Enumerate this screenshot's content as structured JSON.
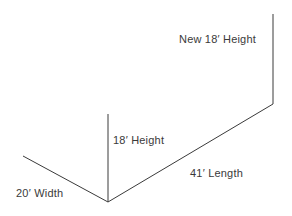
{
  "canvas": {
    "width": 292,
    "height": 216,
    "background_color": "#ffffff",
    "stroke_color": "#3a3a3a",
    "text_color": "#3a3a3a"
  },
  "diagram": {
    "labels": {
      "new_height": "New 18′ Height",
      "height": "18′ Height",
      "length": "41′ Length",
      "width": "20′ Width"
    },
    "measurements": [
      {
        "name": "new-height",
        "value": 18,
        "unit": "ft",
        "unit_symbol": "′",
        "text": "New 18′ Height"
      },
      {
        "name": "height",
        "value": 18,
        "unit": "ft",
        "unit_symbol": "′",
        "text": "18′ Height"
      },
      {
        "name": "length",
        "value": 41,
        "unit": "ft",
        "unit_symbol": "′",
        "text": "41′ Length"
      },
      {
        "name": "width",
        "value": 20,
        "unit": "ft",
        "unit_symbol": "′",
        "text": "20′ Width"
      }
    ],
    "geometry": {
      "vertex": {
        "x": 108,
        "y": 202
      },
      "lines": [
        {
          "name": "new-height-line",
          "x1": 273,
          "y1": 14,
          "x2": 273,
          "y2": 104
        },
        {
          "name": "length-line",
          "x1": 273,
          "y1": 104,
          "x2": 108,
          "y2": 202
        },
        {
          "name": "height-line",
          "x1": 108,
          "y1": 114,
          "x2": 108,
          "y2": 202
        },
        {
          "name": "width-line",
          "x1": 23,
          "y1": 156,
          "x2": 108,
          "y2": 202
        }
      ]
    }
  }
}
